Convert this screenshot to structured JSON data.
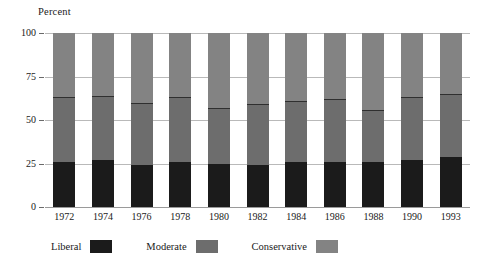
{
  "chart_data": {
    "type": "bar",
    "subtype": "stacked-bar-100",
    "title": "",
    "xlabel": "",
    "ylabel": "Percent",
    "ylim": [
      0,
      100
    ],
    "yticks": [
      "0",
      "25",
      "50",
      "75",
      "100"
    ],
    "grid": true,
    "legend_position": "bottom",
    "categories": [
      "1972",
      "1974",
      "1976",
      "1978",
      "1980",
      "1982",
      "1984",
      "1986",
      "1988",
      "1990",
      "1993"
    ],
    "series": [
      {
        "name": "Liberal",
        "color": "#1b1b1b",
        "values": [
          26,
          27,
          24,
          26,
          25,
          24,
          26,
          26,
          26,
          27,
          29
        ]
      },
      {
        "name": "Moderate",
        "color": "#6d6d6d",
        "values": [
          37,
          37,
          36,
          37,
          32,
          35,
          35,
          36,
          30,
          36,
          36
        ]
      },
      {
        "name": "Conservative",
        "color": "#838383",
        "values": [
          37,
          36,
          40,
          37,
          43,
          41,
          39,
          38,
          44,
          37,
          35
        ]
      }
    ],
    "cumulative_tops": {
      "liberal": [
        26,
        27,
        24,
        26,
        25,
        24,
        26,
        26,
        26,
        27,
        29
      ],
      "liberal_plus_moderate": [
        63,
        64,
        60,
        63,
        57,
        59,
        61,
        62,
        56,
        63,
        65
      ],
      "total": [
        100,
        100,
        100,
        100,
        100,
        100,
        100,
        100,
        100,
        100,
        100
      ]
    }
  },
  "axis": {
    "y_title": "Percent",
    "y_ticks": [
      {
        "label": "100",
        "value": 100
      },
      {
        "label": "75",
        "value": 75
      },
      {
        "label": "50",
        "value": 50
      },
      {
        "label": "25",
        "value": 25
      },
      {
        "label": "0",
        "value": 0
      }
    ],
    "x_ticks": [
      "1972",
      "1974",
      "1976",
      "1978",
      "1980",
      "1982",
      "1984",
      "1986",
      "1988",
      "1990",
      "1993"
    ]
  },
  "legend": {
    "items": [
      {
        "label": "Liberal",
        "color": "#1b1b1b"
      },
      {
        "label": "Moderate",
        "color": "#6d6d6d"
      },
      {
        "label": "Conservative",
        "color": "#838383"
      }
    ]
  },
  "colors": {
    "background": "#ffffff",
    "text": "#1a1a1a",
    "gridline": "#b9b9b9",
    "baseline": "#9a9a9a",
    "liberal": "#1b1b1b",
    "moderate": "#6d6d6d",
    "conservative": "#838383"
  }
}
